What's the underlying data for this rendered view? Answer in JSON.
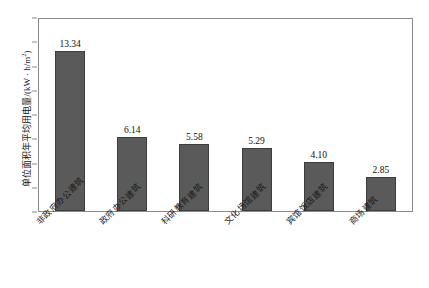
{
  "chart_data": {
    "type": "bar",
    "title": "",
    "xlabel": "",
    "ylabel": "单位面积年平均用电量/(kW · h/m²)",
    "ylabel_main": "单位面积年平均用电量/(kW · h/m",
    "ylabel_sup": "2",
    "ylabel_tail": ")",
    "categories": [
      "非政府办公建筑",
      "政府办公建筑",
      "科研教育建筑",
      "文化场馆建筑",
      "宾馆饭店建筑",
      "商场建筑"
    ],
    "values": [
      13.34,
      6.14,
      5.58,
      5.29,
      4.1,
      2.85
    ],
    "value_labels": [
      "13.34",
      "6.14",
      "5.58",
      "5.29",
      "4.10",
      "2.85"
    ],
    "ylim": [
      0,
      16
    ],
    "ytick_values": [
      0,
      2,
      4,
      6,
      8,
      10,
      12,
      14,
      16
    ],
    "ytick_labels": [
      "0",
      "2",
      "4",
      "6",
      "8",
      "10",
      "12",
      "14",
      "16"
    ],
    "grid": false,
    "legend": "none",
    "bar_color": "#5a5a5a",
    "bar_edge_color": "#3d3d3d",
    "frame_color": "#8a8a8a",
    "background": "#ffffff"
  }
}
